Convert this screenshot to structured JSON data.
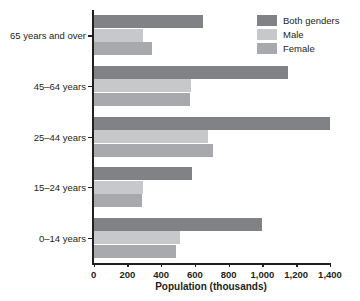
{
  "chart_data": {
    "type": "bar",
    "orientation": "horizontal",
    "title": "",
    "xlabel": "Population (thousands)",
    "ylabel": "",
    "categories": [
      "0–14 years",
      "15–24 years",
      "25–44 years",
      "45–64 years",
      "65 years and over"
    ],
    "series": [
      {
        "name": "Both genders",
        "color": "#808285",
        "values": [
          1000,
          580,
          1400,
          1150,
          650
        ]
      },
      {
        "name": "Male",
        "color": "#c7c8ca",
        "values": [
          510,
          295,
          675,
          575,
          295
        ]
      },
      {
        "name": "Female",
        "color": "#a7a9ac",
        "values": [
          490,
          285,
          705,
          570,
          345
        ]
      }
    ],
    "xlim": [
      0,
      1400
    ],
    "xticks": [
      0,
      200,
      400,
      600,
      800,
      1000,
      1200,
      1400
    ],
    "xtick_labels": [
      "0",
      "200",
      "400",
      "600",
      "800",
      "1,000",
      "1,200",
      "1,400"
    ],
    "grid": false,
    "legend_position": "top-right",
    "legend_entries": [
      "Both genders",
      "Male",
      "Female"
    ]
  }
}
